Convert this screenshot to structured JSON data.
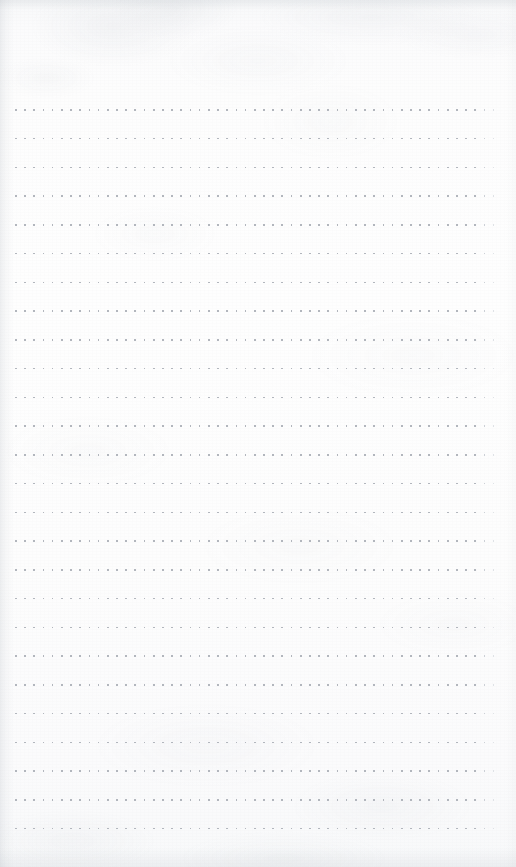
{
  "page": {
    "kind": "dot-grid-paper-scan",
    "width_px": 516,
    "height_px": 867,
    "orientation": "portrait",
    "content_text": "",
    "annotations": []
  },
  "paper": {
    "base_color": "#fdfdfd",
    "tint_top_color": "#f7f8f9",
    "tint_bottom_color": "#f8f9fa",
    "texture": "mottled-fibrous",
    "has_visible_writing": "false",
    "has_ruled_lines": "false",
    "has_margin_rule": "false"
  },
  "grid": {
    "type": "dot",
    "dot_color": "#b2b6bd",
    "dot_color_faint": "#ccd0d6",
    "dot_size_px": 1.7,
    "column_spacing_px": 9.2,
    "row_spacing_px": 28.75,
    "first_dot_x_px": 15,
    "first_dot_y_px": 109,
    "last_dot_x_px": 496,
    "last_dot_y_px": 828,
    "columns": 53,
    "rows": 26
  },
  "margins": {
    "top_px": 109,
    "bottom_px": 39,
    "left_px": 15,
    "right_px": 20,
    "top_label": "",
    "bottom_label": ""
  },
  "edges": {
    "left_shadow": "true",
    "right_shadow": "false",
    "top_shadow": "true",
    "bottom_shadow": "true"
  }
}
